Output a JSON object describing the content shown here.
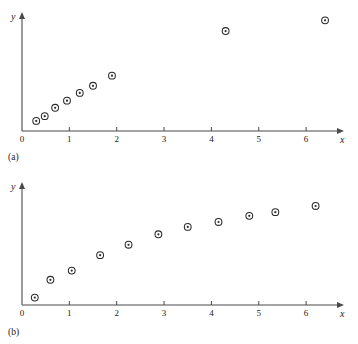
{
  "figure": {
    "panel_a_label": "(a)",
    "panel_b_label": "(b)",
    "x_axis_name": "x",
    "y_axis_name": "y"
  },
  "chart_data": [
    {
      "type": "scatter",
      "panel": "(a)",
      "title": "",
      "xlabel": "x",
      "ylabel": "y",
      "xlim": [
        0,
        6.8
      ],
      "ylim": [
        0,
        10
      ],
      "grid": false,
      "legend": null,
      "xticks": [
        0,
        1,
        2,
        3,
        4,
        5,
        6
      ],
      "xticklabels": [
        "0",
        "1",
        "2",
        "3",
        "4",
        "5",
        "6"
      ],
      "yticks": [],
      "yticklabels": [],
      "marker": "circle-with-center-dot",
      "x": [
        0.3,
        0.48,
        0.7,
        0.95,
        1.22,
        1.5,
        1.9,
        4.3,
        6.4
      ],
      "y": [
        0.85,
        1.25,
        1.95,
        2.55,
        3.2,
        3.8,
        4.65,
        8.4,
        9.3
      ]
    },
    {
      "type": "scatter",
      "panel": "(b)",
      "title": "",
      "xlabel": "x",
      "ylabel": "y",
      "xlim": [
        0,
        6.8
      ],
      "ylim": [
        0,
        10
      ],
      "grid": false,
      "legend": null,
      "xticks": [
        0,
        1,
        2,
        3,
        4,
        5,
        6
      ],
      "xticklabels": [
        "0",
        "1",
        "2",
        "3",
        "4",
        "5",
        "6"
      ],
      "yticks": [],
      "yticklabels": [],
      "marker": "circle-with-center-dot",
      "x": [
        0.27,
        0.6,
        1.05,
        1.65,
        2.25,
        2.88,
        3.5,
        4.15,
        4.8,
        5.35,
        6.2
      ],
      "y": [
        0.6,
        2.05,
        2.8,
        4.05,
        4.9,
        5.75,
        6.35,
        6.75,
        7.25,
        7.55,
        8.05
      ]
    }
  ]
}
